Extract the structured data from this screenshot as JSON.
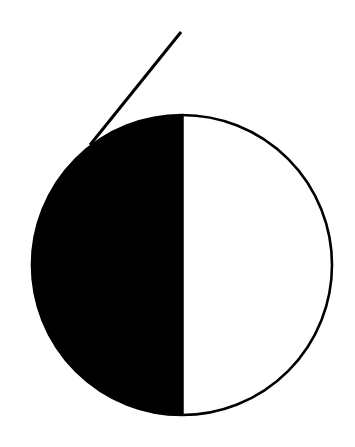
{
  "logo": {
    "label": "Stylized numeral six",
    "glyph": "6",
    "colors": {
      "background": "#ffffff",
      "fill_dark": "#000000",
      "fill_light": "#ffffff",
      "stroke": "#000000"
    },
    "circle": {
      "cx": 182,
      "cy": 265,
      "r": 150,
      "stroke_width": 2.6
    },
    "divider_x": 183,
    "tail": {
      "x1": 181,
      "y1": 32,
      "x2": 90,
      "y2": 145,
      "stroke_width": 3
    }
  }
}
